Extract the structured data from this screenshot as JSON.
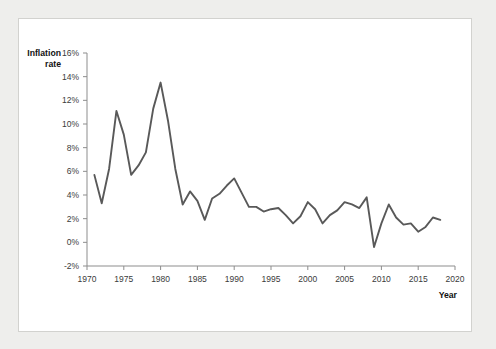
{
  "figure": {
    "background_color": "#eeeeec",
    "panel_color": "#ffffff",
    "panel_border_color": "#d2d2cf",
    "line_color": "#595959",
    "axis_color": "#8d8d8d"
  },
  "labels": {
    "y_axis_title_line1": "Inflation",
    "y_axis_title_line2": "rate",
    "x_axis_title": "Year"
  },
  "chart_data": {
    "type": "line",
    "title": "",
    "xlabel": "Year",
    "ylabel": "Inflation rate",
    "grid": false,
    "legend": "none",
    "xlim": [
      1970,
      2020
    ],
    "ylim": [
      -2,
      16
    ],
    "xticks": [
      1970,
      1975,
      1980,
      1985,
      1990,
      1995,
      2000,
      2005,
      2010,
      2015,
      2020
    ],
    "xtick_labels": [
      "1970",
      "1975",
      "1980",
      "1985",
      "1990",
      "1995",
      "2000",
      "2005",
      "2010",
      "2015",
      "2020"
    ],
    "yticks": [
      -2,
      0,
      2,
      4,
      6,
      8,
      10,
      12,
      14,
      16
    ],
    "ytick_labels": [
      "-2%",
      "0%",
      "2%",
      "4%",
      "6%",
      "8%",
      "10%",
      "12%",
      "14%",
      "16%"
    ],
    "series": [
      {
        "name": "Inflation rate",
        "color": "#595959",
        "x": [
          1971,
          1972,
          1973,
          1974,
          1975,
          1976,
          1977,
          1978,
          1979,
          1980,
          1981,
          1982,
          1983,
          1984,
          1985,
          1986,
          1987,
          1988,
          1989,
          1990,
          1991,
          1992,
          1993,
          1994,
          1995,
          1996,
          1997,
          1998,
          1999,
          2000,
          2001,
          2002,
          2003,
          2004,
          2005,
          2006,
          2007,
          2008,
          2009,
          2010,
          2011,
          2012,
          2013,
          2014,
          2015,
          2016,
          2017,
          2018
        ],
        "values": [
          5.7,
          3.3,
          6.2,
          11.1,
          9.1,
          5.7,
          6.5,
          7.6,
          11.3,
          13.5,
          10.3,
          6.2,
          3.2,
          4.3,
          3.5,
          1.9,
          3.7,
          4.1,
          4.8,
          5.4,
          4.2,
          3.0,
          3.0,
          2.6,
          2.8,
          2.9,
          2.3,
          1.6,
          2.2,
          3.4,
          2.8,
          1.6,
          2.3,
          2.7,
          3.4,
          3.2,
          2.9,
          3.8,
          -0.4,
          1.6,
          3.2,
          2.1,
          1.5,
          1.6,
          0.9,
          1.3,
          2.1,
          1.9
        ]
      }
    ]
  }
}
